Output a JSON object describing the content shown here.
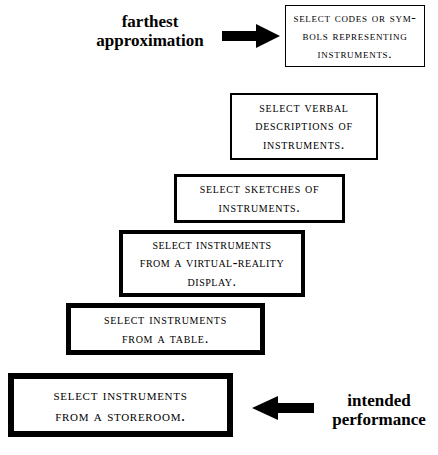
{
  "diagram": {
    "title_label_top": "farthest\napproximation",
    "title_label_bottom": "intended\nperformance",
    "arrow_top_direction": "right",
    "arrow_bottom_direction": "left",
    "colors": {
      "background": "#ffffff",
      "ink": "#000000"
    },
    "steps": [
      {
        "index": 1,
        "text": "Select codes or sym-\nbols representing\ninstruments.",
        "border_width_px": 1
      },
      {
        "index": 2,
        "text": "Select verbal\ndescriptions of\ninstruments.",
        "border_width_px": 2
      },
      {
        "index": 3,
        "text": "Select sketches of\ninstruments.",
        "border_width_px": 3
      },
      {
        "index": 4,
        "text": "Select instruments\nfrom a virtual-reality\ndisplay.",
        "border_width_px": 4
      },
      {
        "index": 5,
        "text": "Select instruments\nfrom a table.",
        "border_width_px": 5
      },
      {
        "index": 6,
        "text": "Select instruments\nfrom a storeroom.",
        "border_width_px": 6
      }
    ]
  }
}
